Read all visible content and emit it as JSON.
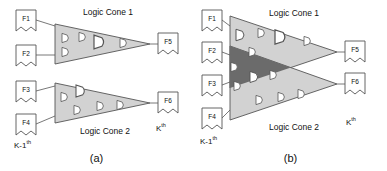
{
  "figure": {
    "panels": [
      {
        "id": "a",
        "caption": "(a)",
        "cones": [
          {
            "name": "cone1",
            "label": "Logic Cone 1",
            "gates": 5,
            "fill": "#d2d2d2"
          },
          {
            "name": "cone2",
            "label": "Logic Cone 2",
            "gates": 6,
            "fill": "#d2d2d2"
          }
        ],
        "inputs": [
          {
            "name": "F1",
            "label": "F1"
          },
          {
            "name": "F2",
            "label": "F2"
          },
          {
            "name": "F3",
            "label": "F3"
          },
          {
            "name": "F4",
            "label": "F4"
          }
        ],
        "outputs": [
          {
            "name": "F5",
            "label": "F5"
          },
          {
            "name": "F6",
            "label": "F6"
          }
        ],
        "stage_left": "K-1",
        "stage_left_sup": "th",
        "stage_right": "K",
        "stage_right_sup": "th"
      },
      {
        "id": "b",
        "caption": "(b)",
        "cones": [
          {
            "name": "cone1",
            "label": "Logic Cone 1",
            "gates": 5,
            "fill": "#d2d2d2"
          },
          {
            "name": "cone2",
            "label": "Logic Cone 2",
            "gates": 6,
            "fill": "#d2d2d2"
          }
        ],
        "overlap": {
          "name": "shared-logic-overlap",
          "fill": "#6b6b6b",
          "gates": 4
        },
        "inputs": [
          {
            "name": "F1",
            "label": "F1"
          },
          {
            "name": "F2",
            "label": "F2"
          },
          {
            "name": "F3",
            "label": "F3"
          },
          {
            "name": "F4",
            "label": "F4"
          }
        ],
        "outputs": [
          {
            "name": "F5",
            "label": "F5"
          },
          {
            "name": "F6",
            "label": "F6"
          }
        ],
        "stage_left": "K-1",
        "stage_left_sup": "th",
        "stage_right": "K",
        "stage_right_sup": "th"
      }
    ],
    "colors": {
      "cone_fill": "#d2d2d2",
      "overlap_fill": "#6b6b6b",
      "gate_fill": "#ffffff",
      "stroke": "#555555",
      "text": "#111111",
      "background": "#ffffff"
    }
  }
}
